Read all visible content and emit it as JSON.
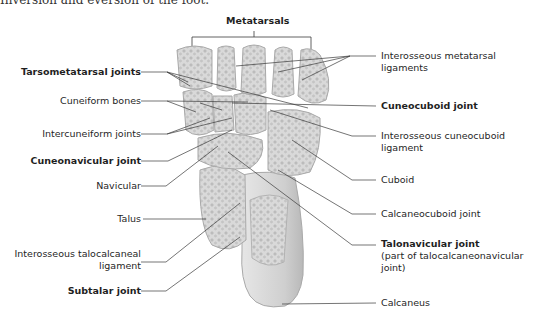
{
  "caption": "Inversion and eversion of the foot.",
  "figure": {
    "bone_color": "#dcdcdc",
    "bone_edge": "#a9a9a9",
    "leader_color": "#3a3a3a",
    "labels_left": [
      {
        "id": "tarsometatarsal-joints",
        "text": "Tarsometatarsal joints",
        "bold": true
      },
      {
        "id": "cuneiform-bones",
        "text": "Cuneiform bones",
        "bold": false
      },
      {
        "id": "intercuneiform-joints",
        "text": "Intercuneiform joints",
        "bold": false
      },
      {
        "id": "cuneonavicular-joint",
        "text": "Cuneonavicular joint",
        "bold": true
      },
      {
        "id": "navicular",
        "text": "Navicular",
        "bold": false
      },
      {
        "id": "talus",
        "text": "Talus",
        "bold": false
      },
      {
        "id": "interosseous-talocalcaneal-ligament",
        "text": "Interosseous talocalcaneal",
        "text2": "ligament",
        "bold": false
      },
      {
        "id": "subtalar-joint",
        "text": "Subtalar joint",
        "bold": true
      }
    ],
    "labels_top": [
      {
        "id": "metatarsals",
        "text": "Metatarsals",
        "bold": true
      }
    ],
    "labels_right": [
      {
        "id": "interosseous-metatarsal-ligaments",
        "text": "Interosseous metatarsal",
        "text2": "ligaments",
        "bold": false
      },
      {
        "id": "cuneocuboid-joint",
        "text": "Cuneocuboid joint",
        "bold": true
      },
      {
        "id": "interosseous-cuneocuboid-ligament",
        "text": "Interosseous cuneocuboid",
        "text2": "ligament",
        "bold": false
      },
      {
        "id": "cuboid",
        "text": "Cuboid",
        "bold": false
      },
      {
        "id": "calcaneocuboid-joint",
        "text": "Calcaneocuboid joint",
        "bold": false
      },
      {
        "id": "talonavicular-joint",
        "text": "Talonavicular joint",
        "text2": "(part of talocalcaneonavicular",
        "text3": "joint)",
        "bold": true
      },
      {
        "id": "calcaneus",
        "text": "Calcaneus",
        "bold": false
      }
    ]
  }
}
